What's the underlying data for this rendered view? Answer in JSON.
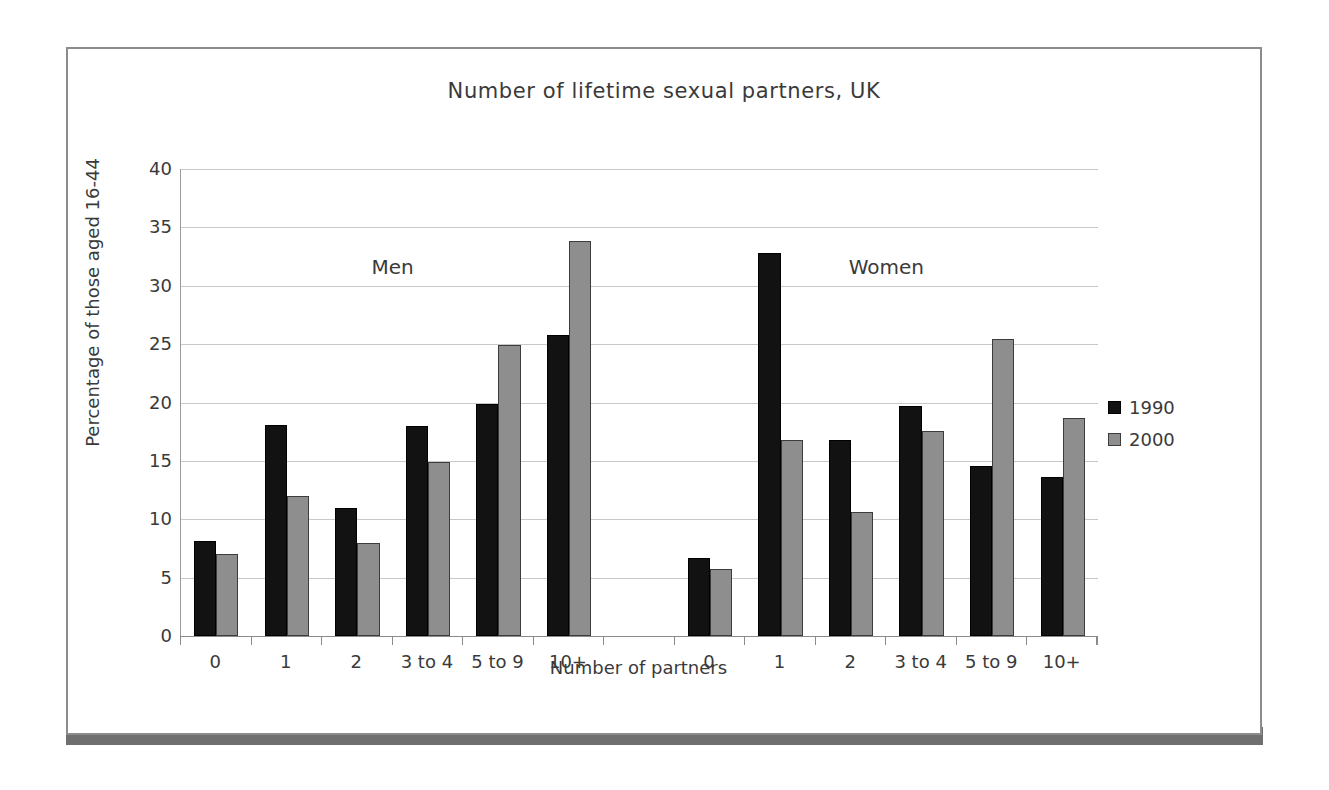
{
  "chart_data": {
    "type": "bar",
    "title": "Number of lifetime sexual partners, UK",
    "xlabel": "Number of partners",
    "ylabel": "Percentage of those aged 16-44",
    "ylim": [
      0,
      40
    ],
    "ytick_step": 5,
    "yticks": [
      0,
      5,
      10,
      15,
      20,
      25,
      30,
      35,
      40
    ],
    "grid": true,
    "legend_position": "right",
    "legend": [
      "1990",
      "2000"
    ],
    "colors": {
      "series_1990": "#121212",
      "series_2000": "#8e8e8e",
      "gridline": "#c8c8c8",
      "axis": "#8a8a8a",
      "frame": "#8c8c8c",
      "shadow": "#6f6f6f"
    },
    "group_labels": [
      "Men",
      "Women"
    ],
    "categories": [
      "0",
      "1",
      "2",
      "3 to 4",
      "5 to 9",
      "10+"
    ],
    "groups": [
      {
        "label": "Men",
        "categories": [
          "0",
          "1",
          "2",
          "3 to 4",
          "5 to 9",
          "10+"
        ],
        "series": [
          {
            "name": "1990",
            "values": [
              8.1,
              18.1,
              11.0,
              18.0,
              19.9,
              25.8
            ]
          },
          {
            "name": "2000",
            "values": [
              7.0,
              12.0,
              8.0,
              14.9,
              24.9,
              33.8
            ]
          }
        ]
      },
      {
        "label": "Women",
        "categories": [
          "0",
          "1",
          "2",
          "3 to 4",
          "5 to 9",
          "10+"
        ],
        "series": [
          {
            "name": "1990",
            "values": [
              6.7,
              32.8,
              16.8,
              19.7,
              14.6,
              13.6
            ]
          },
          {
            "name": "2000",
            "values": [
              5.7,
              16.8,
              10.6,
              17.6,
              25.4,
              18.7
            ]
          }
        ]
      }
    ]
  },
  "figure": {
    "title": "Number of lifetime sexual partners, UK",
    "x_axis_title": "Number of partners",
    "y_axis_title": "Percentage of those aged 16-44",
    "annotation_men": "Men",
    "annotation_women": "Women",
    "legend_1990": "1990",
    "legend_2000": "2000"
  }
}
